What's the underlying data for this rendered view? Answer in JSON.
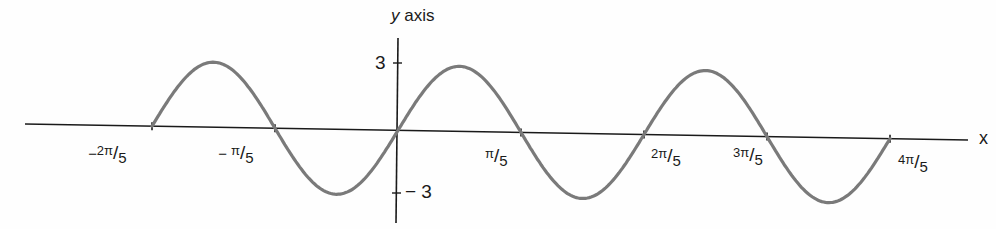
{
  "chart_data": {
    "type": "line",
    "title": "",
    "function": "y = 3 sin(5x)",
    "xlabel": "x",
    "ylabel": "y axis",
    "xlim_label": [
      "-2π/5",
      "4π/5"
    ],
    "ylim": [
      -3,
      3
    ],
    "grid": false,
    "legend": null,
    "x_ticks": [
      {
        "value": -1.2566,
        "sign": "−",
        "num": "2π",
        "den": "5"
      },
      {
        "value": -0.6283,
        "sign": "− ",
        "num": "π",
        "den": "5"
      },
      {
        "value": 0.6283,
        "sign": "",
        "num": "π",
        "den": "5"
      },
      {
        "value": 1.2566,
        "sign": "",
        "num": "2π",
        "den": "5"
      },
      {
        "value": 1.885,
        "sign": "",
        "num": "3π",
        "den": "5"
      },
      {
        "value": 2.5133,
        "sign": "",
        "num": "4π",
        "den": "5"
      }
    ],
    "y_ticks": [
      {
        "value": 3,
        "label": "3"
      },
      {
        "value": -3,
        "label": "− 3"
      }
    ],
    "series": [
      {
        "name": "3 sin(5x)",
        "color": "#7a7a7a",
        "x": [
          -1.2566,
          -0.9425,
          -0.6283,
          -0.3142,
          0,
          0.3142,
          0.6283,
          0.9425,
          1.2566,
          1.5708,
          1.885,
          2.1991,
          2.5133
        ],
        "y": [
          0,
          3,
          0,
          -3,
          0,
          3,
          0,
          -3,
          0,
          3,
          0,
          -3,
          0
        ]
      }
    ]
  },
  "axes": {
    "x_title": "x",
    "y_title_var": "y",
    "y_title_rest": " axis"
  },
  "colors": {
    "axis": "#1a1a1a",
    "curve": "#7a7a7a",
    "background": "#fefefe"
  }
}
